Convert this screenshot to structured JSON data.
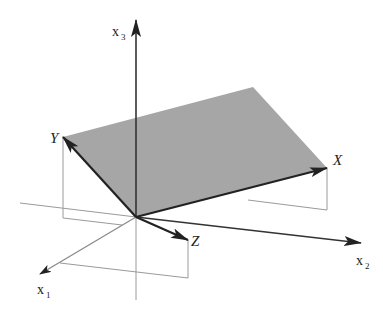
{
  "diagram": {
    "type": "3d-vector-plane",
    "colors": {
      "plane_fill": "#a6a6a6",
      "vector_stroke": "#222222",
      "guide_stroke": "#9a9a9a",
      "axis_stroke": "#333333",
      "background": "#ffffff"
    },
    "axes": [
      {
        "id": "x1",
        "label": "x",
        "subscript": "1"
      },
      {
        "id": "x2",
        "label": "x",
        "subscript": "2"
      },
      {
        "id": "x3",
        "label": "x",
        "subscript": "3"
      }
    ],
    "vectors": [
      {
        "id": "X",
        "label": "X"
      },
      {
        "id": "Y",
        "label": "Y"
      },
      {
        "id": "Z",
        "label": "Z"
      }
    ],
    "plane": {
      "description": "Plane spanned by vectors X and Y"
    }
  }
}
